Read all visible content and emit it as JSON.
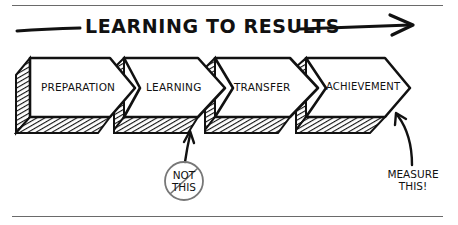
{
  "title": "LEARNING TO RESULTS",
  "steps": [
    {
      "label": "PREPARATION"
    },
    {
      "label": "LEARNING"
    },
    {
      "label": "TRANSFER"
    },
    {
      "label": "ACHIEVEMENT"
    }
  ],
  "annotations": {
    "not_this": {
      "line1": "NOT",
      "line2": "THIS",
      "points_to": "LEARNING"
    },
    "measure_this": {
      "line1": "MEASURE",
      "line2": "THIS!",
      "points_to": "ACHIEVEMENT"
    }
  },
  "colors": {
    "ink": "#111111",
    "rule": "#6a6a6a",
    "background": "#ffffff",
    "circle": "#777777"
  }
}
